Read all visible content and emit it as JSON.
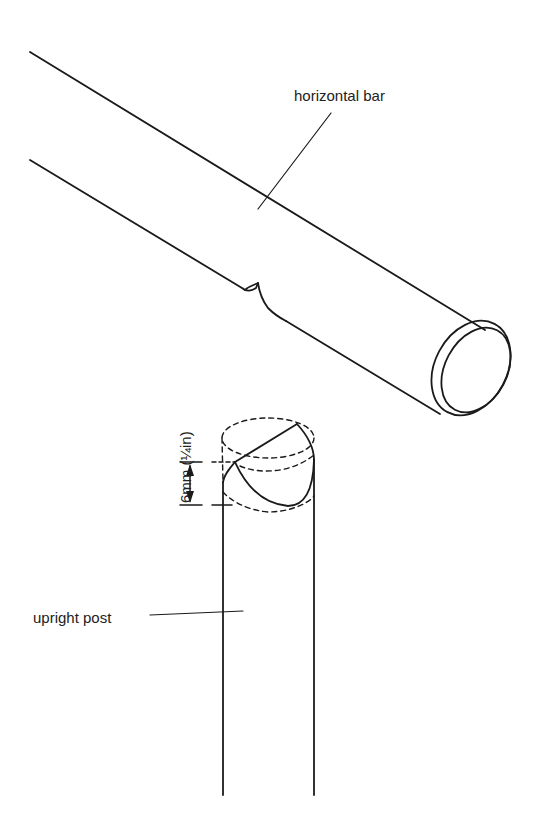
{
  "diagram": {
    "labels": {
      "horizontal_bar": "horizontal bar",
      "upright_post": "upright post",
      "dimension": "6mm (¼in)"
    },
    "parts": [
      {
        "name": "horizontal bar",
        "type": "cylindrical rail with notch and chamfered end"
      },
      {
        "name": "upright post",
        "type": "cylindrical post with rounded top cut"
      }
    ],
    "dimension": {
      "value": "6mm",
      "imperial": "¼in",
      "orientation": "vertical"
    },
    "colors": {
      "stroke": "#1a1a1a",
      "background": "#ffffff",
      "text": "#222222"
    }
  }
}
